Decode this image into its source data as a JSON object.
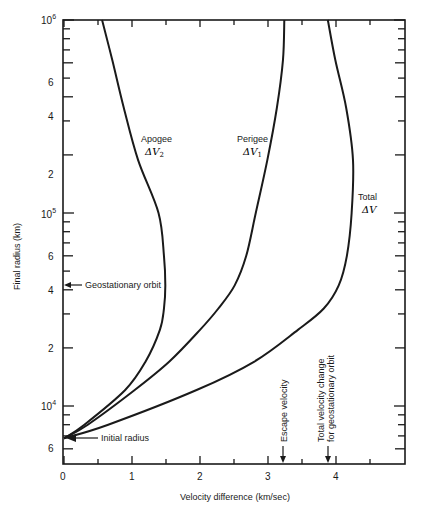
{
  "chart_data": {
    "type": "line",
    "title": "",
    "xlabel": "Velocity difference (km/sec)",
    "ylabel": "Final radius (km)",
    "xlim": [
      0,
      5
    ],
    "ylim": [
      5000,
      1000000
    ],
    "yscale": "log",
    "grid": false,
    "x_ticks": [
      0,
      1,
      2,
      3,
      4
    ],
    "x_minor_ticks": [
      0.5,
      1.5,
      2.5,
      3.5,
      4.5
    ],
    "y_major_ticks": [
      {
        "value": 1000000,
        "label": "10",
        "sup": "6"
      },
      {
        "value": 100000,
        "label": "10",
        "sup": "5"
      },
      {
        "value": 10000,
        "label": "10",
        "sup": "4"
      }
    ],
    "y_minor_labels": [
      {
        "value": 600000,
        "label": "6"
      },
      {
        "value": 400000,
        "label": "4"
      },
      {
        "value": 200000,
        "label": "2"
      },
      {
        "value": 60000,
        "label": "6"
      },
      {
        "value": 40000,
        "label": "4"
      },
      {
        "value": 20000,
        "label": "2"
      },
      {
        "value": 6000,
        "label": "6"
      }
    ],
    "series": [
      {
        "name": "Apogee ΔV2",
        "label_line1": "Apogee",
        "label_line2": "ΔV",
        "label_sub": "2",
        "r": [
          6800,
          8000,
          12100,
          17000,
          24800,
          32000,
          42164,
          60000,
          100000,
          188000,
          350000,
          620000,
          1000000
        ],
        "dv": [
          0,
          0.3,
          0.9,
          1.2,
          1.41,
          1.47,
          1.49,
          1.47,
          1.39,
          1.09,
          0.88,
          0.71,
          0.56
        ]
      },
      {
        "name": "Perigee ΔV1",
        "label_line1": "Perigee",
        "label_line2": "ΔV",
        "label_sub": "1",
        "r": [
          6800,
          8000,
          12100,
          17000,
          24800,
          32000,
          42164,
          60000,
          100000,
          188000,
          350000,
          620000,
          1000000
        ],
        "dv": [
          0,
          0.35,
          1.04,
          1.55,
          2.0,
          2.27,
          2.51,
          2.68,
          2.82,
          2.99,
          3.13,
          3.22,
          3.24
        ]
      },
      {
        "name": "Total ΔV",
        "label_line1": "Total",
        "label_line2": "ΔV",
        "label_sub": "",
        "r": [
          6800,
          8000,
          12100,
          17000,
          24800,
          32000,
          42164,
          60000,
          100000,
          188000,
          350000,
          620000,
          1000000
        ],
        "dv": [
          0,
          0.65,
          1.95,
          2.8,
          3.44,
          3.82,
          4.04,
          4.16,
          4.23,
          4.25,
          4.15,
          3.99,
          3.88
        ]
      }
    ],
    "annotations": [
      {
        "text": "Geostationary orbit",
        "r": 42164,
        "type": "arrow-left-axis"
      },
      {
        "text": "Initial radius",
        "r": 6800,
        "type": "arrow-left-axis"
      },
      {
        "text": "Escape velocity",
        "x": 3.22,
        "type": "arrow-down-x-axis"
      },
      {
        "text_line1": "Total velocity change",
        "text_line2": "for geostationary orbit",
        "x": 3.85,
        "type": "arrow-down-x-axis"
      }
    ]
  },
  "labels": {
    "x_axis_title": "Velocity difference (km/sec)",
    "y_axis_title": "Final radius (km)",
    "geo_orbit": "Geostationary orbit",
    "initial_radius": "Initial radius",
    "escape_velocity": "Escape velocity",
    "total_change_line1": "Total velocity change",
    "total_change_line2": "for geostationary orbit",
    "apogee_line1": "Apogee",
    "perigee_line1": "Perigee",
    "total_line1": "Total",
    "delta_v": "ΔV",
    "sub_1": "1",
    "sub_2": "2",
    "x_tick_0": "0",
    "x_tick_1": "1",
    "x_tick_2": "2",
    "x_tick_3": "3",
    "x_tick_4": "4",
    "y_ten": "10",
    "y_sup_6": "6",
    "y_sup_5": "5",
    "y_sup_4": "4",
    "y_6": "6",
    "y_4": "4",
    "y_2": "2"
  }
}
